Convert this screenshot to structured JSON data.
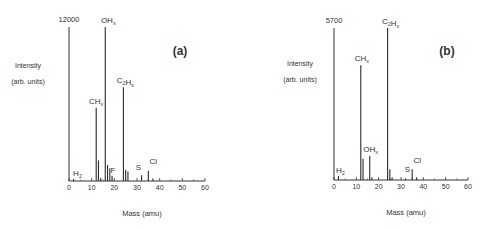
{
  "chart_data": [
    {
      "type": "bar",
      "panel_label": "(a)",
      "title": "",
      "xlabel": "Mass (amu)",
      "ylabel": [
        "Intensity",
        "(arb. units)"
      ],
      "ymax_label": "12000",
      "xlim": [
        0,
        60
      ],
      "ylim": [
        0,
        12000
      ],
      "xticks": [
        0,
        10,
        20,
        30,
        40,
        50,
        60
      ],
      "grid": false,
      "peaks": [
        {
          "mass": 2,
          "value": 150,
          "label": "H2"
        },
        {
          "mass": 12,
          "value": 5700,
          "label": "CHx"
        },
        {
          "mass": 13,
          "value": 1600,
          "label": ""
        },
        {
          "mass": 14,
          "value": 250,
          "label": ""
        },
        {
          "mass": 16,
          "value": 12000,
          "label": "OHx"
        },
        {
          "mass": 17,
          "value": 1250,
          "label": ""
        },
        {
          "mass": 18,
          "value": 1000,
          "label": ""
        },
        {
          "mass": 19,
          "value": 400,
          "label": "F"
        },
        {
          "mass": 24,
          "value": 7300,
          "label": "C2Hx"
        },
        {
          "mass": 25,
          "value": 850,
          "label": ""
        },
        {
          "mass": 26,
          "value": 750,
          "label": ""
        },
        {
          "mass": 32,
          "value": 450,
          "label": "S"
        },
        {
          "mass": 35,
          "value": 800,
          "label": "Cl"
        },
        {
          "mass": 37,
          "value": 200,
          "label": ""
        }
      ]
    },
    {
      "type": "bar",
      "panel_label": "(b)",
      "title": "",
      "xlabel": "Mass (amu)",
      "ylabel": [
        "Intensity",
        "(arb. units)"
      ],
      "ymax_label": "5700",
      "xlim": [
        0,
        60
      ],
      "ylim": [
        0,
        5700
      ],
      "xticks": [
        0,
        10,
        20,
        30,
        40,
        50,
        60
      ],
      "grid": false,
      "peaks": [
        {
          "mass": 2,
          "value": 150,
          "label": "H2"
        },
        {
          "mass": 12,
          "value": 4300,
          "label": "CHx"
        },
        {
          "mass": 13,
          "value": 800,
          "label": ""
        },
        {
          "mass": 16,
          "value": 900,
          "label": "OHx"
        },
        {
          "mass": 17,
          "value": 100,
          "label": ""
        },
        {
          "mass": 24,
          "value": 5700,
          "label": "C2Hx"
        },
        {
          "mass": 25,
          "value": 400,
          "label": ""
        },
        {
          "mass": 26,
          "value": 100,
          "label": ""
        },
        {
          "mass": 32,
          "value": 60,
          "label": "S"
        },
        {
          "mass": 35,
          "value": 400,
          "label": "Cl"
        },
        {
          "mass": 37,
          "value": 100,
          "label": ""
        }
      ]
    }
  ]
}
